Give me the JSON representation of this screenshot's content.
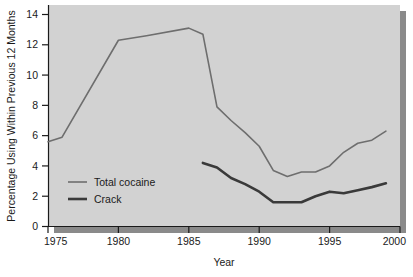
{
  "chart_data": {
    "type": "line",
    "title": "",
    "xlabel": "Year",
    "ylabel": "Percentage Using Within Previous 12 Months",
    "xlim": [
      1975,
      2000
    ],
    "ylim": [
      0,
      14
    ],
    "xticks": [
      "1975",
      "1980",
      "1985",
      "1990",
      "1995",
      "2000"
    ],
    "yticks": [
      "0",
      "2",
      "4",
      "6",
      "8",
      "10",
      "12",
      "14"
    ],
    "grid": false,
    "legend_position": "inside-lower-left",
    "series": [
      {
        "name": "Total cocaine",
        "color": "#6e6e6e",
        "width": 1.6,
        "x": [
          1975,
          1976,
          1980,
          1982,
          1985,
          1986,
          1987,
          1988,
          1989,
          1990,
          1991,
          1992,
          1993,
          1994,
          1995,
          1996,
          1997,
          1998,
          1999
        ],
        "values": [
          5.6,
          5.9,
          12.3,
          12.6,
          13.1,
          12.7,
          7.9,
          7.0,
          6.2,
          5.3,
          3.7,
          3.3,
          3.6,
          3.6,
          4.0,
          4.9,
          5.5,
          5.7,
          6.3
        ]
      },
      {
        "name": "Crack",
        "color": "#3a3a3a",
        "width": 2.6,
        "x": [
          1986,
          1987,
          1988,
          1989,
          1990,
          1991,
          1992,
          1993,
          1994,
          1995,
          1996,
          1997,
          1998,
          1999
        ],
        "values": [
          4.2,
          3.9,
          3.2,
          2.8,
          2.3,
          1.6,
          1.6,
          1.6,
          2.0,
          2.3,
          2.2,
          2.4,
          2.6,
          2.85
        ]
      }
    ]
  },
  "colors": {
    "plot_background": "#d2d2d2",
    "page_background": "#ffffff",
    "axis": "#1a1a1a",
    "shadow": "#8a8a8a",
    "total_cocaine": "#6e6e6e",
    "crack": "#3a3a3a"
  },
  "axes": {
    "y_title": "Percentage Using Within Previous 12 Months",
    "x_title": "Year",
    "y_tick_labels": [
      "14",
      "12",
      "10",
      "8",
      "6",
      "4",
      "2",
      "0"
    ],
    "x_tick_labels": [
      "1975",
      "1980",
      "1985",
      "1990",
      "1995",
      "2000"
    ]
  },
  "legend": {
    "items": [
      {
        "label": "Total cocaine"
      },
      {
        "label": "Crack"
      }
    ]
  }
}
